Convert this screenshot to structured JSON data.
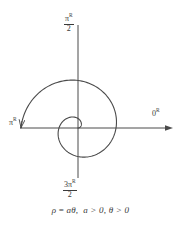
{
  "figure": {
    "equation": "ρ = aθ,  a > 0, θ > 0",
    "equation_parts": {
      "rho": "ρ",
      "equals": "=",
      "a_theta": "aθ",
      "comma": ",",
      "cond_a": "a > 0",
      "cond_theta": "θ > 0"
    },
    "axis_labels": {
      "right": {
        "value": "0",
        "superscript": "R"
      },
      "left": {
        "value": "π",
        "superscript": "R"
      },
      "top": {
        "numerator": "π",
        "superscript": "R",
        "denominator": "2"
      },
      "bottom": {
        "numerator": "3π",
        "superscript": "R",
        "denominator": "2"
      }
    },
    "colors": {
      "curve": "#4a4a4a",
      "axis": "#4a4a4a",
      "text": "#3a3a3a",
      "background": "#ffffff"
    }
  },
  "chart_data": {
    "type": "line",
    "curve_equation": "ρ = aθ,  a > 0, θ > 0",
    "coordinate_system": "polar",
    "xlabel": "",
    "ylabel": "",
    "grid": false,
    "legend": null,
    "origin_px": [
      78,
      128
    ],
    "theta_range_radians": [
      0,
      9.42
    ],
    "theta_range_label": [
      "0",
      "3π"
    ],
    "a_pixels_per_radian": 6.05,
    "annotations": [
      {
        "text": "0",
        "superscript": "R",
        "angle_radians": 0,
        "position": "right-axis-end"
      },
      {
        "text": "π/2",
        "superscript": "R",
        "angle_radians": 1.5708,
        "position": "top-axis-end"
      },
      {
        "text": "π",
        "superscript": "R",
        "angle_radians": 3.1416,
        "position": "left-axis-end"
      },
      {
        "text": "3π/2",
        "superscript": "R",
        "angle_radians": 4.7124,
        "position": "bottom-axis-end"
      }
    ],
    "series": [
      {
        "name": "spiral",
        "polar_points": [
          {
            "theta": 0.0,
            "rho": 0
          },
          {
            "theta": 0.7854,
            "rho": 4.75
          },
          {
            "theta": 1.5708,
            "rho": 9.5
          },
          {
            "theta": 2.3562,
            "rho": 14.25
          },
          {
            "theta": 3.1416,
            "rho": 19.0
          },
          {
            "theta": 3.927,
            "rho": 23.75
          },
          {
            "theta": 4.7124,
            "rho": 28.5
          },
          {
            "theta": 5.4978,
            "rho": 33.25
          },
          {
            "theta": 6.2832,
            "rho": 38.0
          },
          {
            "theta": 7.0686,
            "rho": 42.75
          },
          {
            "theta": 7.854,
            "rho": 47.5
          },
          {
            "theta": 8.6394,
            "rho": 52.25
          },
          {
            "theta": 9.4248,
            "rho": 57.0
          }
        ]
      }
    ],
    "axes": [
      {
        "name": "horizontal",
        "from_px": [
          20,
          128
        ],
        "to_px": [
          172,
          128
        ],
        "arrow": "right"
      },
      {
        "name": "vertical",
        "from_px": [
          78,
          25
        ],
        "to_px": [
          78,
          178
        ],
        "arrow": "none"
      }
    ]
  }
}
